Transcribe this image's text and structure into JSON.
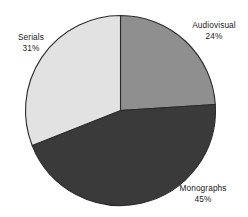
{
  "chart_data": {
    "type": "pie",
    "title": "",
    "subtitle": "",
    "xlabel": "",
    "ylabel": "",
    "legend_position": "none",
    "grid": false,
    "labels_inline": true,
    "start_angle_deg": 0,
    "direction": "clockwise",
    "categories": [
      "Audiovisual",
      "Monographs",
      "Serials"
    ],
    "values": [
      24,
      45,
      31
    ],
    "unit": "%",
    "colors": [
      "#8f8f8f",
      "#3a3a3a",
      "#e2e2e2"
    ],
    "slices": [
      {
        "label": "Audiovisual",
        "value": 24,
        "value_text": "24%",
        "color": "#8f8f8f",
        "start_deg": 0,
        "end_deg": 86.4
      },
      {
        "label": "Monographs",
        "value": 45,
        "value_text": "45%",
        "color": "#3a3a3a",
        "start_deg": 86.4,
        "end_deg": 248.4
      },
      {
        "label": "Serials",
        "value": 31,
        "value_text": "31%",
        "color": "#e2e2e2",
        "start_deg": 248.4,
        "end_deg": 360
      }
    ]
  },
  "style": {
    "background": "#ffffff",
    "outline": "#2b2b2b",
    "text": "#1a1a1a"
  },
  "labels": {
    "audiovisual": {
      "name": "Audiovisual",
      "percent": "24%"
    },
    "monographs": {
      "name": "Monographs",
      "percent": "45%"
    },
    "serials": {
      "name": "Serials",
      "percent": "31%"
    }
  }
}
